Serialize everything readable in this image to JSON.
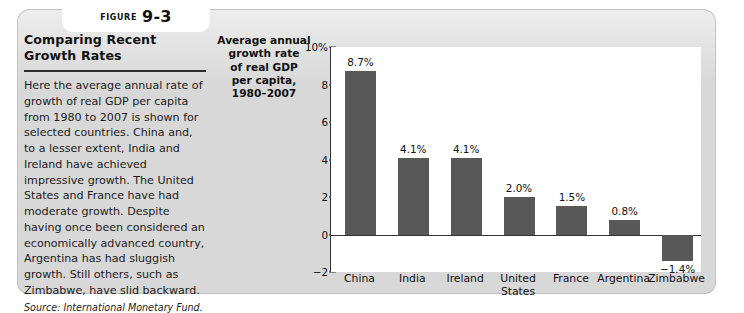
{
  "figure": {
    "label_word": "Figure",
    "number": "9-3"
  },
  "caption": {
    "title": "Comparing Recent Growth Rates",
    "body": "Here the average annual rate of growth of real GDP per capita from 1980 to 2007 is shown for selected countries. China and, to a lesser extent, India and Ireland have achieved impressive growth. The United States and France have had moderate growth. Despite having once been considered an economically advanced country, Argentina has had sluggish growth. Still others, such as Zimbabwe, have slid backward.",
    "source": "Source: International Monetary Fund."
  },
  "chart_data": {
    "type": "bar",
    "title": "",
    "ylabel": "Average annual growth rate of real GDP per capita, 1980–2007",
    "xlabel": "",
    "categories": [
      "China",
      "India",
      "Ireland",
      "United States",
      "France",
      "Argentina",
      "Zimbabwe"
    ],
    "values": [
      8.7,
      4.1,
      4.1,
      2.0,
      1.5,
      0.8,
      -1.4
    ],
    "value_labels": [
      "8.7%",
      "4.1%",
      "4.1%",
      "2.0%",
      "1.5%",
      "0.8%",
      "−1.4%"
    ],
    "ylim": [
      -2,
      10
    ],
    "yticks": [
      10,
      8,
      6,
      4,
      2,
      0,
      -2
    ],
    "ytick_labels": [
      "10%",
      "8",
      "6",
      "4",
      "2",
      "0",
      "−2"
    ],
    "grid": false,
    "legend": false,
    "bar_color": "#585858",
    "units": "percent"
  },
  "colors": {
    "panel_background": "#d8d8d8",
    "plot_background": "#ffffff",
    "bar": "#585858",
    "axis": "#333333",
    "text": "#111111"
  }
}
